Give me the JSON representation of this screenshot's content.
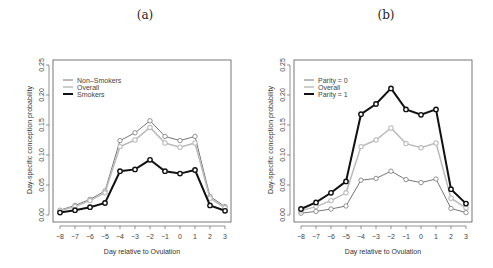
{
  "panels": [
    {
      "title": "(a)"
    },
    {
      "title": "(b)"
    }
  ],
  "chart_data": [
    {
      "type": "line",
      "title": "(a)",
      "xlabel": "Day relative to Ovulation",
      "ylabel": "Day-specific conception probability",
      "x": [
        -8,
        -7,
        -6,
        -5,
        -4,
        -3,
        -2,
        -1,
        0,
        1,
        2,
        3
      ],
      "x_tick_labels": [
        "-8",
        "-7",
        "-6",
        "-5",
        "-4",
        "-3",
        "-2",
        "-1",
        "0",
        "1",
        "2",
        "3"
      ],
      "y_tick_labels": [
        "0.00",
        "0.05",
        "0.10",
        "0.15",
        "0.20",
        "0.25"
      ],
      "ylim": [
        0,
        0.25
      ],
      "grid": false,
      "legend_position": "top-left",
      "series": [
        {
          "name": "Non-Smokers",
          "color": "#777777",
          "width": 1,
          "values": [
            0.008,
            0.016,
            0.026,
            0.04,
            0.124,
            0.137,
            0.157,
            0.131,
            0.124,
            0.131,
            0.031,
            0.014
          ]
        },
        {
          "name": "Overall",
          "color": "#bbbbbb",
          "width": 1.5,
          "values": [
            0.007,
            0.014,
            0.024,
            0.037,
            0.114,
            0.125,
            0.146,
            0.12,
            0.113,
            0.12,
            0.028,
            0.012
          ]
        },
        {
          "name": "Smokers",
          "color": "#111111",
          "width": 2,
          "values": [
            0.004,
            0.008,
            0.013,
            0.02,
            0.073,
            0.076,
            0.092,
            0.073,
            0.069,
            0.075,
            0.016,
            0.007
          ]
        }
      ]
    },
    {
      "type": "line",
      "title": "(b)",
      "xlabel": "Day relative to Ovulation",
      "ylabel": "Day-specific conception probability",
      "x": [
        -8,
        -7,
        -6,
        -5,
        -4,
        -3,
        -2,
        -1,
        0,
        1,
        2,
        3
      ],
      "x_tick_labels": [
        "-8",
        "-7",
        "-6",
        "-5",
        "-4",
        "-3",
        "-2",
        "-1",
        "0",
        "1",
        "2",
        "3"
      ],
      "y_tick_labels": [
        "0.00",
        "0.05",
        "0.10",
        "0.15",
        "0.20",
        "0.25"
      ],
      "ylim": [
        0,
        0.25
      ],
      "grid": false,
      "legend_position": "top-left",
      "series": [
        {
          "name": "Parity = 0",
          "color": "#777777",
          "width": 1,
          "values": [
            0.003,
            0.006,
            0.01,
            0.015,
            0.058,
            0.061,
            0.073,
            0.059,
            0.054,
            0.06,
            0.011,
            0.004
          ]
        },
        {
          "name": "Overall",
          "color": "#bbbbbb",
          "width": 1.5,
          "values": [
            0.007,
            0.014,
            0.024,
            0.037,
            0.114,
            0.125,
            0.145,
            0.119,
            0.112,
            0.12,
            0.028,
            0.012
          ]
        },
        {
          "name": "Parity = 1",
          "color": "#111111",
          "width": 2,
          "values": [
            0.01,
            0.021,
            0.037,
            0.056,
            0.168,
            0.185,
            0.211,
            0.176,
            0.167,
            0.176,
            0.043,
            0.019
          ]
        }
      ]
    }
  ]
}
